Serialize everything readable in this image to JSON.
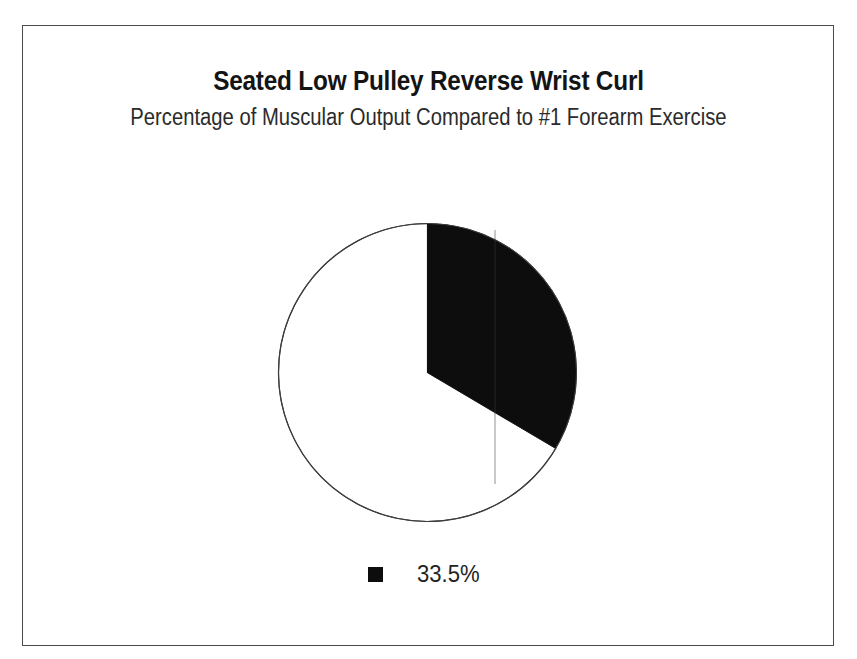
{
  "figure": {
    "title": "Seated Low Pulley Reverse Wrist Curl",
    "subtitle": "Percentage of Muscular Output Compared to #1 Forearm Exercise",
    "background_color": "#ffffff",
    "border_color": "#4a4a4a"
  },
  "legend": {
    "entries": [
      {
        "label": "33.5%",
        "color": "#0d0d0d",
        "swatch_name": "legend-swatch-black"
      }
    ],
    "position": "bottom-center"
  },
  "chart_data": {
    "type": "pie",
    "title": "Seated Low Pulley Reverse Wrist Curl",
    "subtitle": "Percentage of Muscular Output Compared to #1 Forearm Exercise",
    "xlabel": "",
    "ylabel": "",
    "categories": [
      "33.5%",
      ""
    ],
    "values": [
      33.5,
      66.5
    ],
    "colors": [
      "#0d0d0d",
      "#ffffff"
    ],
    "labels": [
      "33.5%",
      ""
    ],
    "units": "percent",
    "start_angle_deg": 90,
    "direction": "clockwise",
    "slice_angles_deg": [
      120.6,
      239.4
    ],
    "outline_color": "#3d3d3d",
    "legend_position": "bottom-center",
    "grid": false,
    "annotations": []
  },
  "geometry": {
    "center_x": 427,
    "center_y": 372,
    "radius": 149
  }
}
